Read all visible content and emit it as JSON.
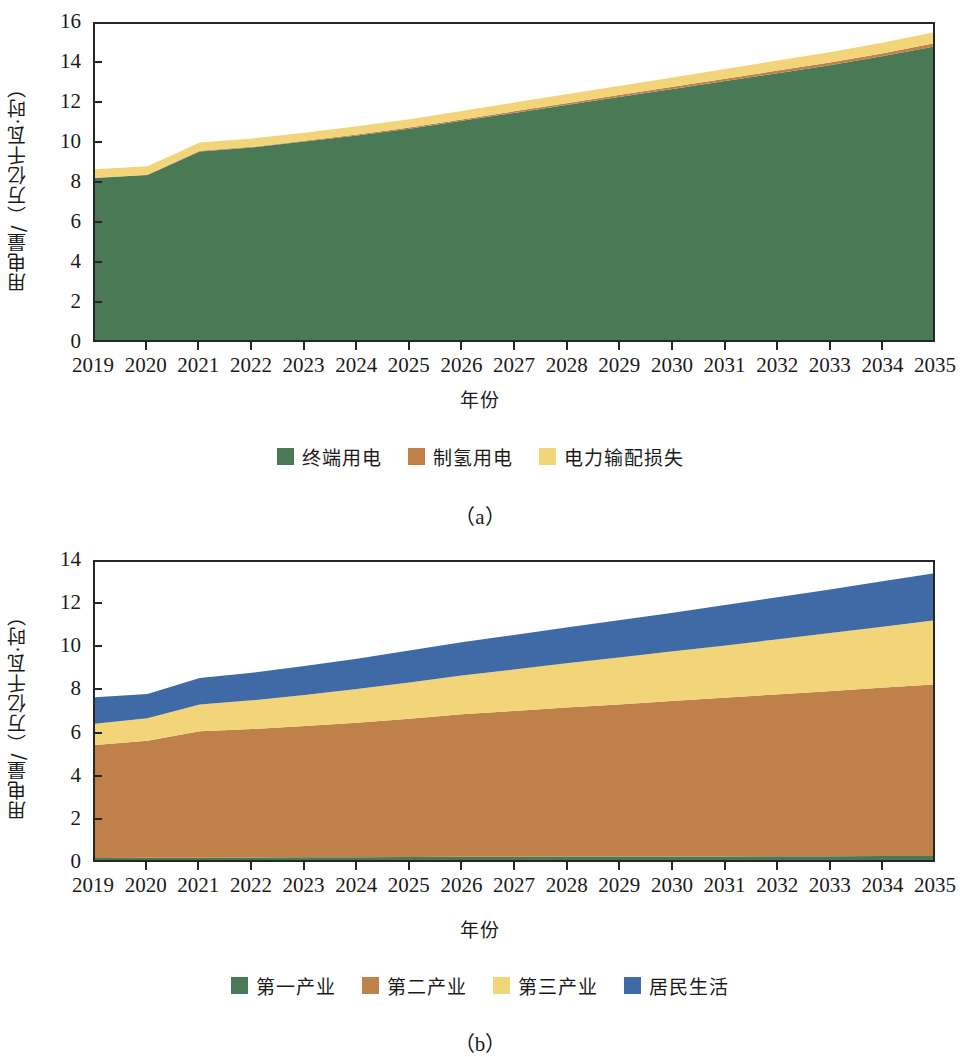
{
  "colors": {
    "green": "#4a7a55",
    "brown": "#c0804a",
    "yellow": "#f2d579",
    "blue": "#3f6aa5",
    "axis": "#262626"
  },
  "panel_a": {
    "caption": "（a）",
    "ylabel": "用电量/（万亿千瓦·时）",
    "xlabel": "年份",
    "legend": [
      {
        "label": "终端用电",
        "color": "#4a7a55"
      },
      {
        "label": "制氢用电",
        "color": "#c0804a"
      },
      {
        "label": "电力输配损失",
        "color": "#f2d579"
      }
    ]
  },
  "panel_b": {
    "caption": "（b）",
    "ylabel": "用电量/（万亿千瓦·时）",
    "xlabel": "年份",
    "legend": [
      {
        "label": "第一产业",
        "color": "#4a7a55"
      },
      {
        "label": "第二产业",
        "color": "#c0804a"
      },
      {
        "label": "第三产业",
        "color": "#f2d579"
      },
      {
        "label": "居民生活",
        "color": "#3f6aa5"
      }
    ]
  },
  "chart_data": [
    {
      "type": "area",
      "panel": "a",
      "title": "",
      "xlabel": "年份",
      "ylabel": "用电量/（万亿千瓦·时）",
      "xlim": [
        2019,
        2035
      ],
      "ylim": [
        0,
        16
      ],
      "ytick_labels": [
        "0",
        "2",
        "4",
        "6",
        "8",
        "10",
        "12",
        "14",
        "16"
      ],
      "yticks": [
        0,
        2,
        4,
        6,
        8,
        10,
        12,
        14,
        16
      ],
      "categories": [
        2019,
        2020,
        2021,
        2022,
        2023,
        2024,
        2025,
        2026,
        2027,
        2028,
        2029,
        2030,
        2031,
        2032,
        2033,
        2034,
        2035
      ],
      "xtick_labels": [
        "2019",
        "2020",
        "2021",
        "2022",
        "2023",
        "2024",
        "2025",
        "2026",
        "2027",
        "2028",
        "2029",
        "2030",
        "2031",
        "2032",
        "2033",
        "2034",
        "2035"
      ],
      "stacked": true,
      "grid": false,
      "legend_position": "bottom",
      "series": [
        {
          "name": "终端用电",
          "color": "#4a7a55",
          "values": [
            8.2,
            8.35,
            9.55,
            9.75,
            10.05,
            10.35,
            10.7,
            11.1,
            11.5,
            11.9,
            12.3,
            12.7,
            13.1,
            13.5,
            13.9,
            14.35,
            14.85
          ]
        },
        {
          "name": "制氢用电",
          "color": "#c0804a",
          "values": [
            0.02,
            0.02,
            0.03,
            0.03,
            0.04,
            0.05,
            0.06,
            0.07,
            0.08,
            0.09,
            0.1,
            0.11,
            0.12,
            0.13,
            0.14,
            0.15,
            0.16
          ]
        },
        {
          "name": "电力输配损失",
          "color": "#f2d579",
          "values": [
            0.43,
            0.43,
            0.42,
            0.42,
            0.41,
            0.42,
            0.42,
            0.43,
            0.44,
            0.45,
            0.46,
            0.47,
            0.49,
            0.51,
            0.52,
            0.54,
            0.56
          ]
        }
      ],
      "totals": [
        8.65,
        8.8,
        10.0,
        10.2,
        10.5,
        10.82,
        11.18,
        11.6,
        12.02,
        12.44,
        12.86,
        13.28,
        13.71,
        14.14,
        14.56,
        15.04,
        15.57
      ]
    },
    {
      "type": "area",
      "panel": "b",
      "title": "",
      "xlabel": "年份",
      "ylabel": "用电量/（万亿千瓦·时）",
      "xlim": [
        2019,
        2035
      ],
      "ylim": [
        0,
        14
      ],
      "ytick_labels": [
        "0",
        "2",
        "4",
        "6",
        "8",
        "10",
        "12",
        "14"
      ],
      "yticks": [
        0,
        2,
        4,
        6,
        8,
        10,
        12,
        14
      ],
      "categories": [
        2019,
        2020,
        2021,
        2022,
        2023,
        2024,
        2025,
        2026,
        2027,
        2028,
        2029,
        2030,
        2031,
        2032,
        2033,
        2034,
        2035
      ],
      "xtick_labels": [
        "2019",
        "2020",
        "2021",
        "2022",
        "2023",
        "2024",
        "2025",
        "2026",
        "2027",
        "2028",
        "2029",
        "2030",
        "2031",
        "2032",
        "2033",
        "2034",
        "2035"
      ],
      "stacked": true,
      "grid": false,
      "legend_position": "bottom",
      "series": [
        {
          "name": "第一产业",
          "color": "#4a7a55",
          "values": [
            0.09,
            0.1,
            0.11,
            0.12,
            0.13,
            0.13,
            0.14,
            0.15,
            0.15,
            0.16,
            0.16,
            0.17,
            0.17,
            0.18,
            0.18,
            0.19,
            0.19
          ]
        },
        {
          "name": "第二产业",
          "color": "#c0804a",
          "values": [
            5.31,
            5.5,
            5.94,
            6.03,
            6.17,
            6.32,
            6.5,
            6.7,
            6.85,
            7.0,
            7.15,
            7.3,
            7.45,
            7.6,
            7.75,
            7.9,
            8.06
          ]
        },
        {
          "name": "第三产业",
          "color": "#f2d579",
          "values": [
            1.0,
            1.06,
            1.25,
            1.35,
            1.45,
            1.58,
            1.7,
            1.82,
            1.95,
            2.08,
            2.2,
            2.32,
            2.45,
            2.58,
            2.72,
            2.86,
            3.0
          ]
        },
        {
          "name": "居民生活",
          "color": "#3f6aa5",
          "values": [
            1.24,
            1.14,
            1.25,
            1.3,
            1.37,
            1.43,
            1.5,
            1.56,
            1.62,
            1.68,
            1.75,
            1.82,
            1.9,
            1.97,
            2.05,
            2.13,
            2.21
          ]
        }
      ],
      "totals": [
        7.64,
        7.8,
        8.55,
        8.8,
        9.12,
        9.46,
        9.84,
        10.23,
        10.57,
        10.92,
        11.26,
        11.61,
        11.97,
        12.33,
        12.7,
        13.08,
        13.46
      ]
    }
  ]
}
